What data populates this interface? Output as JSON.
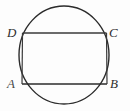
{
  "figure": {
    "type": "inscribed-rectangle-in-circle",
    "background_color": "#fdfdfd",
    "stroke_color": "#2b2b2b",
    "labels": {
      "top_left": "D",
      "top_right": "C",
      "bottom_left": "A",
      "bottom_right": "B"
    },
    "circle": {
      "center_x": 64,
      "center_y": 55,
      "radius_x": 45,
      "radius_y": 49,
      "stroke_width": 1.4
    },
    "rectangle": {
      "left": 22.5,
      "top": 33,
      "right": 106.5,
      "bottom": 84,
      "width": 84,
      "height": 51,
      "stroke_width": 1.3,
      "top_side_label": "DC",
      "bottom_side_label": "AB",
      "left_side_label": "DA",
      "right_side_label": "CB"
    }
  }
}
